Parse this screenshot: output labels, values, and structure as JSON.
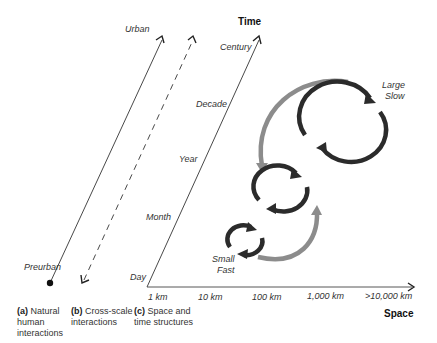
{
  "panels": {
    "a": {
      "tag": "(a)",
      "caption_lines": [
        "Natural",
        "human",
        "interactions"
      ],
      "top_label": "Urban",
      "bottom_label": "Preurban"
    },
    "b": {
      "tag": "(b)",
      "caption_lines": [
        "Cross-scale",
        "interactions"
      ]
    },
    "c": {
      "tag": "(c)",
      "caption_lines": [
        "Space and",
        "time structures"
      ]
    }
  },
  "axes": {
    "time": {
      "title": "Time",
      "ticks": [
        "Day",
        "Month",
        "Year",
        "Decade",
        "Century"
      ]
    },
    "space": {
      "title": "Space",
      "ticks": [
        "1 km",
        "10 km",
        "100 km",
        "1,000 km",
        ">10,000 km"
      ]
    }
  },
  "cycles": {
    "large": {
      "line1": "Large",
      "line2": "Slow"
    },
    "small": {
      "line1": "Small",
      "line2": "Fast"
    }
  },
  "colors": {
    "cycle": "#2b2b2b",
    "cross_scale_arrow": "#8c8c8c",
    "axis": "#333333"
  }
}
